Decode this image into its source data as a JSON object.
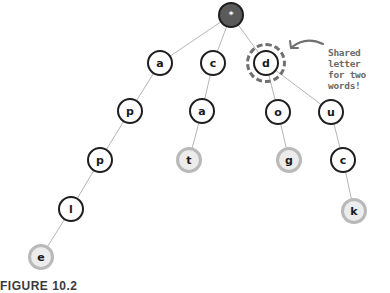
{
  "diagram": {
    "type": "trie",
    "root": {
      "id": "root",
      "label": "*",
      "x": 231,
      "y": 15
    },
    "nodes": [
      {
        "id": "a1",
        "label": "a",
        "x": 160,
        "y": 63,
        "terminal": false
      },
      {
        "id": "c1",
        "label": "c",
        "x": 213,
        "y": 63,
        "terminal": false
      },
      {
        "id": "d1",
        "label": "d",
        "x": 266,
        "y": 63,
        "terminal": false,
        "highlighted": true
      },
      {
        "id": "p1",
        "label": "p",
        "x": 130,
        "y": 111,
        "terminal": false
      },
      {
        "id": "a2",
        "label": "a",
        "x": 202,
        "y": 111,
        "terminal": false
      },
      {
        "id": "o1",
        "label": "o",
        "x": 278,
        "y": 112,
        "terminal": false
      },
      {
        "id": "u1",
        "label": "u",
        "x": 331,
        "y": 112,
        "terminal": false
      },
      {
        "id": "p2",
        "label": "p",
        "x": 100,
        "y": 160,
        "terminal": false
      },
      {
        "id": "t1",
        "label": "t",
        "x": 189,
        "y": 160,
        "terminal": true
      },
      {
        "id": "g1",
        "label": "g",
        "x": 289,
        "y": 160,
        "terminal": true
      },
      {
        "id": "c2",
        "label": "c",
        "x": 343,
        "y": 160,
        "terminal": false
      },
      {
        "id": "l1",
        "label": "l",
        "x": 71,
        "y": 209,
        "terminal": false
      },
      {
        "id": "k1",
        "label": "k",
        "x": 354,
        "y": 211,
        "terminal": true
      },
      {
        "id": "e1",
        "label": "e",
        "x": 41,
        "y": 257,
        "terminal": true
      }
    ],
    "edges": [
      [
        "root",
        "a1"
      ],
      [
        "root",
        "c1"
      ],
      [
        "root",
        "d1"
      ],
      [
        "a1",
        "p1"
      ],
      [
        "p1",
        "p2"
      ],
      [
        "p2",
        "l1"
      ],
      [
        "l1",
        "e1"
      ],
      [
        "c1",
        "a2"
      ],
      [
        "a2",
        "t1"
      ],
      [
        "d1",
        "o1"
      ],
      [
        "o1",
        "g1"
      ],
      [
        "d1",
        "u1"
      ],
      [
        "u1",
        "c2"
      ],
      [
        "c2",
        "k1"
      ]
    ],
    "words": [
      "apple",
      "cat",
      "dog",
      "duck"
    ],
    "annotation": {
      "line1": "Shared letter",
      "line2": "for two words!",
      "target": "d1"
    },
    "caption": "FIGURE 10.2"
  },
  "colors": {
    "edge": "#b5b5b5",
    "node_border": "#1e1e1e",
    "terminal_border": "#b9b9b9",
    "terminal_fill": "#ececec",
    "root_fill": "#5a5a5a",
    "annotation": "#6a6a6a"
  }
}
